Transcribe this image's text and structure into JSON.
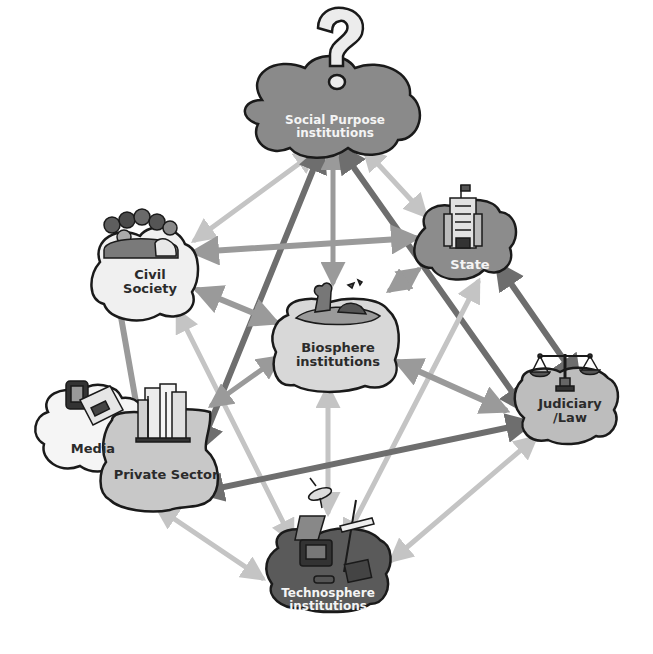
{
  "diagram": {
    "nodes": [
      {
        "id": "social_purpose",
        "label_line1": "Social Purpose",
        "label_line2": "institutions",
        "fill": "#8a8a8a",
        "text": "light",
        "icon": "question-mark-icon"
      },
      {
        "id": "civil_society",
        "label_line1": "Civil",
        "label_line2": "Society",
        "fill": "#f0f0f0",
        "text": "dark",
        "icon": "crowd-of-people-icon"
      },
      {
        "id": "state",
        "label_line1": "State",
        "label_line2": "",
        "fill": "#8c8c8c",
        "text": "light",
        "icon": "government-building-icon"
      },
      {
        "id": "biosphere",
        "label_line1": "Biosphere",
        "label_line2": "institutions",
        "fill": "#d8d8d8",
        "text": "dark",
        "icon": "globe-landscape-icon"
      },
      {
        "id": "media",
        "label_line1": "Media",
        "label_line2": "",
        "fill": "#f5f5f5",
        "text": "dark",
        "icon": "newspaper-tv-icon"
      },
      {
        "id": "private_sector",
        "label_line1": "Private Sector",
        "label_line2": "",
        "fill": "#c8c8c8",
        "text": "dark",
        "icon": "office-buildings-icon"
      },
      {
        "id": "judiciary",
        "label_line1": "Judiciary",
        "label_line2": "/Law",
        "fill": "#bdbdbd",
        "text": "dark",
        "icon": "scales-of-justice-icon"
      },
      {
        "id": "technosphere",
        "label_line1": "Technosphere",
        "label_line2": "institutions",
        "fill": "#5a5a5a",
        "text": "light",
        "icon": "technology-devices-icon"
      }
    ],
    "edges": [
      {
        "from": "social_purpose",
        "to": "civil_society",
        "shade": "light"
      },
      {
        "from": "social_purpose",
        "to": "state",
        "shade": "light"
      },
      {
        "from": "social_purpose",
        "to": "private_sector",
        "shade": "dark"
      },
      {
        "from": "social_purpose",
        "to": "biosphere",
        "shade": "mid"
      },
      {
        "from": "social_purpose",
        "to": "judiciary",
        "shade": "dark"
      },
      {
        "from": "state",
        "to": "civil_society",
        "shade": "mid"
      },
      {
        "from": "state",
        "to": "judiciary",
        "shade": "dark"
      },
      {
        "from": "state",
        "to": "biosphere",
        "shade": "mid"
      },
      {
        "from": "state",
        "to": "technosphere",
        "shade": "light"
      },
      {
        "from": "civil_society",
        "to": "private_sector",
        "shade": "mid"
      },
      {
        "from": "civil_society",
        "to": "biosphere",
        "shade": "mid"
      },
      {
        "from": "civil_society",
        "to": "technosphere",
        "shade": "light"
      },
      {
        "from": "biosphere",
        "to": "private_sector",
        "shade": "mid"
      },
      {
        "from": "biosphere",
        "to": "judiciary",
        "shade": "mid"
      },
      {
        "from": "biosphere",
        "to": "technosphere",
        "shade": "light"
      },
      {
        "from": "judiciary",
        "to": "private_sector",
        "shade": "dark"
      },
      {
        "from": "private_sector",
        "to": "technosphere",
        "shade": "light"
      },
      {
        "from": "technosphere",
        "to": "judiciary",
        "shade": "light"
      }
    ],
    "colors": {
      "arrow_dark": "#6e6e6e",
      "arrow_mid": "#9a9a9a",
      "arrow_light": "#c4c4c4",
      "outline": "#1a1a1a"
    }
  }
}
